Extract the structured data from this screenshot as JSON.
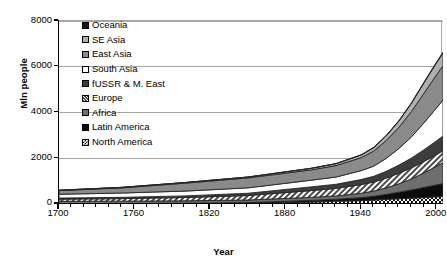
{
  "chart_data": {
    "type": "area",
    "stacked": true,
    "title": "",
    "xlabel": "Year",
    "ylabel": "Mln people",
    "xlim": [
      1700,
      2005
    ],
    "ylim": [
      0,
      8000
    ],
    "xticks": [
      1700,
      1760,
      1820,
      1880,
      1940,
      2000
    ],
    "xticklabels": [
      "1700",
      "1760",
      "1820",
      "1880",
      "1940",
      "2000"
    ],
    "yticks": [
      0,
      2000,
      4000,
      6000,
      8000
    ],
    "yticklabels": [
      "0",
      "2000",
      "4000",
      "6000",
      "8000"
    ],
    "minor_x_step": 10,
    "grid": "horizontal",
    "legend_position": "inside-top-left",
    "x": [
      1700,
      1750,
      1800,
      1850,
      1900,
      1920,
      1940,
      1950,
      1960,
      1970,
      1980,
      1990,
      2000,
      2005
    ],
    "series": [
      {
        "name": "North America",
        "fill": "checker",
        "values": [
          2,
          3,
          7,
          26,
          82,
          117,
          146,
          172,
          204,
          231,
          254,
          283,
          316,
          332
        ]
      },
      {
        "name": "Latin America",
        "fill": "solid-black",
        "values": [
          10,
          16,
          24,
          38,
          74,
          93,
          131,
          167,
          220,
          288,
          362,
          443,
          521,
          558
        ]
      },
      {
        "name": "Africa",
        "fill": "dark-gray",
        "values": [
          106,
          106,
          107,
          111,
          133,
          143,
          191,
          229,
          285,
          366,
          482,
          638,
          819,
          922
        ]
      },
      {
        "name": "Europe",
        "fill": "diagonal-hatch",
        "values": [
          95,
          111,
          146,
          195,
          295,
          329,
          380,
          393,
          425,
          460,
          484,
          499,
          511,
          513
        ]
      },
      {
        "name": "fUSSR & M. East",
        "fill": "very-dark-gray",
        "values": [
          47,
          55,
          71,
          100,
          164,
          180,
          223,
          250,
          297,
          357,
          428,
          513,
          603,
          650
        ]
      },
      {
        "name": "South Asia",
        "fill": "white",
        "values": [
          165,
          190,
          210,
          236,
          290,
          316,
          387,
          444,
          566,
          727,
          926,
          1178,
          1440,
          1570
        ]
      },
      {
        "name": "East Asia",
        "fill": "medium-gray",
        "values": [
          160,
          225,
          345,
          435,
          450,
          500,
          570,
          657,
          787,
          925,
          1110,
          1300,
          1450,
          1500
        ]
      },
      {
        "name": "SE Asia",
        "fill": "light-gray",
        "values": [
          17,
          22,
          28,
          37,
          67,
          83,
          113,
          152,
          201,
          275,
          362,
          452,
          524,
          558
        ]
      },
      {
        "name": "Oceania",
        "fill": "solid-black-small",
        "values": [
          2,
          2,
          2,
          2,
          6,
          9,
          11,
          13,
          16,
          19,
          23,
          26,
          31,
          33
        ]
      }
    ],
    "legend_order_top_to_bottom": [
      "Oceania",
      "SE Asia",
      "East Asia",
      "South Asia",
      "fUSSR & M. East",
      "Europe",
      "Africa",
      "Latin America",
      "North America"
    ],
    "colors": {
      "oceania": "#1a1a1a",
      "se_asia": "#b0b0b0",
      "east_asia": "#8a8a8a",
      "south_asia": "#ffffff",
      "fussr_m_east": "#3d3d3d",
      "europe": "#ffffff",
      "africa": "#6e6e6e",
      "latin_america": "#0d0d0d",
      "north_america": "#ffffff",
      "axis": "#000000",
      "grid": "#a6a6a6",
      "frame": "#a6a6a6",
      "outline": "#262626"
    }
  }
}
